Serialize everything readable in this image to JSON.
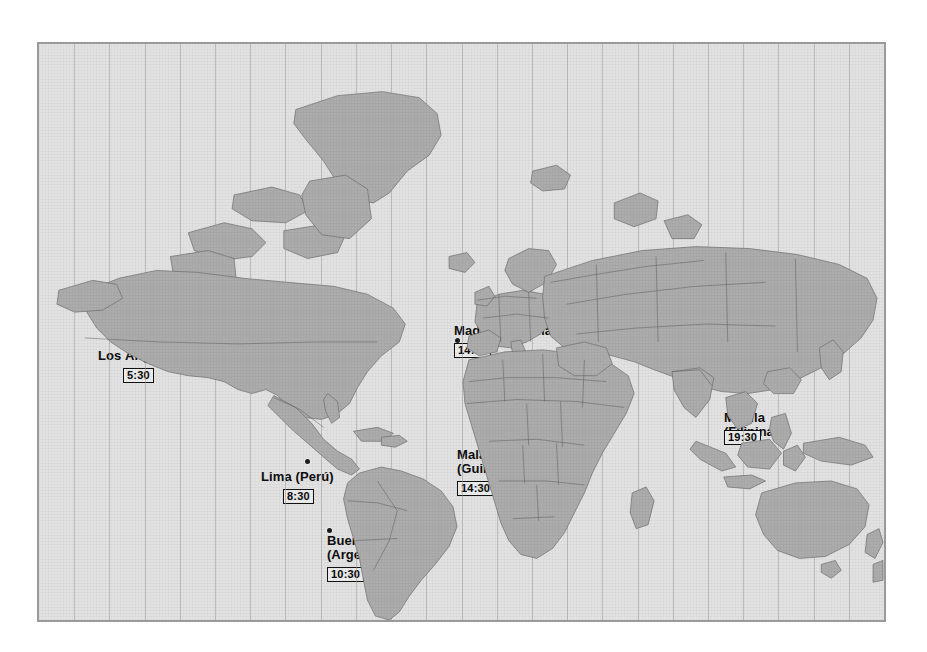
{
  "figure": {
    "kind": "world-timezone-map",
    "background_color": "#ffffff",
    "ocean_color": "#e2e2e2",
    "land_color": "#acacac",
    "border_color": "#9a9a9a",
    "gridline_color": "#9d9d9d",
    "label_color": "#0d0d0d",
    "time_box_fill": "#ededed",
    "gridline_count": 24
  },
  "cities": [
    {
      "id": "los-angeles",
      "name": "Los Ángeles",
      "country": "",
      "time": "5:30",
      "dot": {
        "x": 186,
        "y": 354
      },
      "label": {
        "x": 96,
        "y": 347,
        "align": "left"
      },
      "time_box": {
        "x": 121,
        "y": 363
      }
    },
    {
      "id": "chicago",
      "name": "Chicago",
      "country": "",
      "time": "7:30",
      "dot": {
        "x": 265,
        "y": 340
      },
      "label": {
        "x": 209,
        "y": 334,
        "align": "left"
      },
      "time_box": {
        "x": 209,
        "y": 350
      }
    },
    {
      "id": "nueva-york",
      "name": "Nueva York",
      "country": "",
      "time": "8:30",
      "dot": {
        "x": 288,
        "y": 338
      },
      "label": {
        "x": 288,
        "y": 341,
        "align": "left"
      },
      "time_box": {
        "x": 291,
        "y": 357
      }
    },
    {
      "id": "madrid",
      "name": "Madrid",
      "country": "(España)",
      "time": "14:30",
      "dot": {
        "x": 455,
        "y": 338
      },
      "label": {
        "x": 452,
        "y": 322,
        "align": "left"
      },
      "time_box": {
        "x": 452,
        "y": 338
      }
    },
    {
      "id": "manila",
      "name": "Manila",
      "country": "(Filipinas)",
      "time": "19:30",
      "dot": {
        "x": 742,
        "y": 405
      },
      "label": {
        "x": 722,
        "y": 409,
        "align": "left"
      },
      "time_box": {
        "x": 722,
        "y": 425
      }
    },
    {
      "id": "lima",
      "name": "Lima",
      "country": "(Perú)",
      "time": "8:30",
      "dot": {
        "x": 305,
        "y": 459
      },
      "label": {
        "x": 259,
        "y": 468,
        "align": "left"
      },
      "time_box": {
        "x": 281,
        "y": 484
      }
    },
    {
      "id": "malabo",
      "name": "Malabo",
      "country": "(Guinea Ecuatorial)",
      "time": "14:30",
      "dot": {
        "x": 484,
        "y": 436
      },
      "label": {
        "x": 455,
        "y": 446,
        "align": "left"
      },
      "time_box": {
        "x": 455,
        "y": 476
      }
    },
    {
      "id": "buenos-aires",
      "name": "Buenos Aires",
      "country": "(Argentina)",
      "time": "10:30",
      "dot": {
        "x": 327,
        "y": 528
      },
      "label": {
        "x": 325,
        "y": 532,
        "align": "left"
      },
      "time_box": {
        "x": 325,
        "y": 562
      }
    }
  ]
}
